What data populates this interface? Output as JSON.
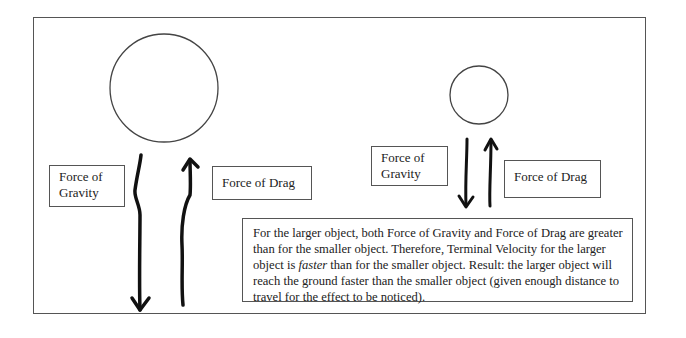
{
  "large_object": {
    "gravity_label_line1": "Force of",
    "gravity_label_line2": "Gravity",
    "drag_label": "Force of Drag"
  },
  "small_object": {
    "gravity_label_line1": "Force of",
    "gravity_label_line2": "Gravity",
    "drag_label": "Force of Drag"
  },
  "explanation": {
    "part1": "For the larger object, both Force of Gravity and Force of Drag are greater than for the smaller object. Therefore, Terminal Velocity for the larger object is ",
    "emphasis": "faster",
    "part2": " than for the smaller object. Result: the larger object will reach the ground faster than the smaller object (given enough distance to travel for the effect to be noticed)."
  }
}
